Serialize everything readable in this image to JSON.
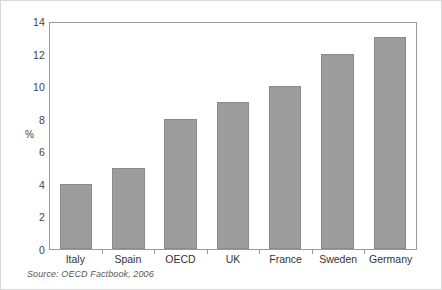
{
  "chart_data": {
    "type": "bar",
    "title": "",
    "subtitle": "",
    "xlabel": "",
    "ylabel": "%",
    "categories": [
      "Italy",
      "Spain",
      "OECD",
      "UK",
      "France",
      "Sweden",
      "Germany"
    ],
    "values": [
      4,
      5,
      8,
      9,
      10,
      12,
      13
    ],
    "series": [
      {
        "name": "",
        "values": [
          4,
          5,
          8,
          9,
          10,
          12,
          13
        ]
      }
    ],
    "ylim": [
      0,
      14
    ],
    "yticks": [
      0,
      2,
      4,
      6,
      8,
      10,
      12,
      14
    ],
    "ytick_labels": [
      "0",
      "2",
      "4",
      "6",
      "8",
      "10",
      "12",
      "14"
    ],
    "grid": false,
    "legend": false,
    "legend_position": "none",
    "bar_color": "#9d9d9d",
    "bar_edge_color": "#8a8a8a",
    "axis_color": "#9a9a9a",
    "background_color": "#ffffff",
    "annotations": []
  },
  "source_note": "Source:  OECD Factbook, 2006"
}
